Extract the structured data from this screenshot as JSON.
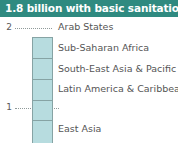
{
  "banner": {
    "title": "1.8 billion with basic sanitation",
    "background_color": "#2f8a80",
    "text_color": "#ffffff"
  },
  "chart_data": {
    "type": "bar",
    "orientation": "vertical-stacked",
    "title": "1.8 billion with basic sanitation",
    "xlabel": "",
    "ylabel": "",
    "unit": "billion people",
    "categories": [
      "Arab States",
      "Sub-Saharan Africa",
      "South-East Asia & Pacific",
      "Latin America & Caribbean",
      "East Asia"
    ],
    "series": [
      {
        "name": "People with basic sanitation",
        "values": [
          0.21,
          0.21,
          0.21,
          0.2,
          0.22
        ]
      }
    ],
    "total": 1.8,
    "axis": {
      "ticks": [
        "1",
        "2"
      ],
      "tick_values": [
        1,
        2
      ],
      "ylim": [
        0,
        2.2
      ],
      "grid": "dotted-leaders"
    },
    "legend": "none",
    "colors": {
      "segment_fill": "#b7dcdf",
      "segment_stroke": "#86a3a4",
      "leader_line": "#8f9a99",
      "label_text": "#555555",
      "tick_text": "#5a5a5a"
    }
  }
}
